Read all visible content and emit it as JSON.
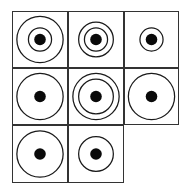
{
  "puzzle": {
    "title": "",
    "rows": 3,
    "cols": 3,
    "line_color": "#333333",
    "dot_color": "#0a0a0a",
    "ring_radius_scale": {
      "S": 6,
      "M": 9,
      "L": 12
    },
    "cells": [
      {
        "row": 0,
        "col": 0,
        "rings": [
          "L",
          "S"
        ],
        "dot": true,
        "empty": false
      },
      {
        "row": 0,
        "col": 1,
        "rings": [
          "M",
          "S"
        ],
        "dot": true,
        "empty": false
      },
      {
        "row": 0,
        "col": 2,
        "rings": [
          "S"
        ],
        "dot": true,
        "empty": false
      },
      {
        "row": 1,
        "col": 0,
        "rings": [
          "L"
        ],
        "dot": true,
        "empty": false
      },
      {
        "row": 1,
        "col": 1,
        "rings": [
          "L",
          "M"
        ],
        "dot": true,
        "empty": false
      },
      {
        "row": 1,
        "col": 2,
        "rings": [
          "L"
        ],
        "dot": true,
        "empty": false
      },
      {
        "row": 2,
        "col": 0,
        "rings": [
          "L"
        ],
        "dot": true,
        "empty": false
      },
      {
        "row": 2,
        "col": 1,
        "rings": [
          "M"
        ],
        "dot": true,
        "empty": false
      },
      {
        "row": 2,
        "col": 2,
        "rings": [],
        "dot": false,
        "empty": true
      }
    ]
  }
}
